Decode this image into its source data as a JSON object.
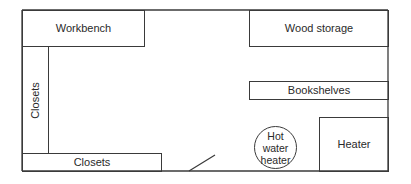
{
  "diagram": {
    "type": "floor-plan",
    "rooms": {
      "workbench": {
        "label": "Workbench"
      },
      "wood_storage": {
        "label": "Wood storage"
      },
      "closets_left": {
        "label": "Closets"
      },
      "bookshelves": {
        "label": "Bookshelves"
      },
      "hot_water_heater": {
        "label": "Hot water heater"
      },
      "heater": {
        "label": "Heater"
      },
      "closets_bottom": {
        "label": "Closets"
      }
    },
    "colors": {
      "line": "#3a3a3a",
      "text": "#2a2a2a",
      "background": "#ffffff"
    }
  }
}
